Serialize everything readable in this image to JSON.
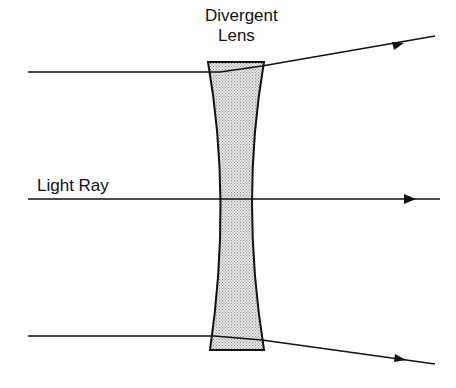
{
  "title": {
    "line1": "Divergent",
    "line2": "Lens"
  },
  "ray_label": "Light Ray",
  "colors": {
    "line": "#111111",
    "lens_fill": "#c8c8c8",
    "background": "#ffffff"
  },
  "lens": {
    "top_left": [
      208,
      62
    ],
    "top_right": [
      264,
      62
    ],
    "waist_left": [
      222,
      199
    ],
    "waist_right": [
      247,
      199
    ],
    "bottom_left": [
      210,
      350
    ],
    "bottom_right": [
      264,
      350
    ]
  },
  "rays": [
    {
      "name": "top",
      "points": [
        [
          28,
          72
        ],
        [
          220,
          72
        ],
        [
          264,
          67
        ],
        [
          435,
          36
        ]
      ],
      "arrow_at": [
        398,
        45
      ]
    },
    {
      "name": "middle",
      "points": [
        [
          28,
          199
        ],
        [
          440,
          199
        ]
      ],
      "arrow_at": [
        410,
        199
      ]
    },
    {
      "name": "bottom",
      "points": [
        [
          28,
          336
        ],
        [
          214,
          336
        ],
        [
          264,
          340
        ],
        [
          435,
          364
        ]
      ],
      "arrow_at": [
        400,
        359
      ]
    }
  ]
}
